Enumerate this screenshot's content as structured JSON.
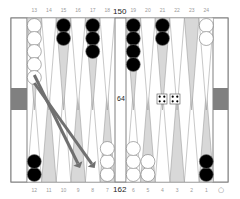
{
  "game": "backgammon",
  "pip_counts": {
    "top": "150",
    "bottom": "162"
  },
  "cube": {
    "value": "64"
  },
  "dice": [
    4,
    4
  ],
  "point_labels": {
    "top": [
      "13",
      "14",
      "15",
      "16",
      "17",
      "18",
      "19",
      "20",
      "21",
      "22",
      "23",
      "24"
    ],
    "bottom": [
      "12",
      "11",
      "10",
      "9",
      "8",
      "7",
      "6",
      "5",
      "4",
      "3",
      "2",
      "1"
    ]
  },
  "turn_indicator": "○",
  "checkers": [
    {
      "point": 13,
      "color": "white",
      "count": 5
    },
    {
      "point": 15,
      "color": "black",
      "count": 2
    },
    {
      "point": 17,
      "color": "black",
      "count": 3
    },
    {
      "point": 19,
      "color": "black",
      "count": 4
    },
    {
      "point": 21,
      "color": "black",
      "count": 2
    },
    {
      "point": 24,
      "color": "white",
      "count": 2
    },
    {
      "point": 12,
      "color": "black",
      "count": 2
    },
    {
      "point": 7,
      "color": "white",
      "count": 3
    },
    {
      "point": 6,
      "color": "white",
      "count": 3
    },
    {
      "point": 5,
      "color": "white",
      "count": 2
    },
    {
      "point": 1,
      "color": "black",
      "count": 2
    }
  ],
  "moves": [
    {
      "from": 13,
      "to": 9
    },
    {
      "from": 13,
      "to": 8
    }
  ],
  "colors": {
    "frame": "#808080",
    "triangle_dark": "#d8d8d8",
    "triangle_light": "#ffffff",
    "bar_marker": "#808080",
    "arrow": "#707070",
    "black_checker": "#000000",
    "white_checker": "#ffffff"
  }
}
